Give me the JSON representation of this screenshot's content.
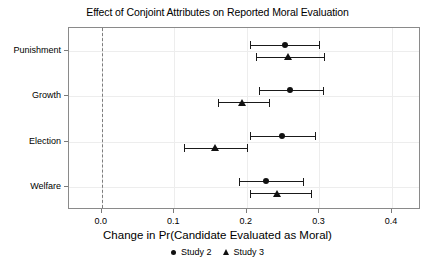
{
  "chart_data": {
    "type": "scatter",
    "title": "Effect of Conjoint Attributes on Reported Moral Evaluation",
    "xlabel": "Change in Pr(Candidate Evaluated as Moral)",
    "ylabel": "",
    "xlim": [
      -0.045,
      0.44
    ],
    "xticks": [
      0.0,
      0.1,
      0.2,
      0.3,
      0.4
    ],
    "xticklabels": [
      "0.0",
      "0.1",
      "0.2",
      "0.3",
      "0.4"
    ],
    "categories": [
      "Punishment",
      "Growth",
      "Election",
      "Welfare"
    ],
    "grid": true,
    "reference_line": 0.0,
    "legend_position": "bottom",
    "series": [
      {
        "name": "Study 2",
        "marker": "circle",
        "values": [
          0.253,
          0.259,
          0.249,
          0.227
        ],
        "ci_low": [
          0.205,
          0.217,
          0.204,
          0.189
        ],
        "ci_high": [
          0.3,
          0.305,
          0.294,
          0.277
        ]
      },
      {
        "name": "Study 3",
        "marker": "triangle",
        "values": [
          0.257,
          0.194,
          0.156,
          0.242
        ],
        "ci_low": [
          0.212,
          0.16,
          0.114,
          0.204
        ],
        "ci_high": [
          0.306,
          0.231,
          0.2,
          0.288
        ]
      }
    ]
  }
}
